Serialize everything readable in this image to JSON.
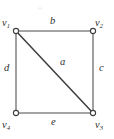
{
  "figure": {
    "type": "graph-diagram",
    "background_color": "#ffffff",
    "line_color": "#4a4a4a",
    "diagonal_color": "#3d3d3d",
    "text_color": "#2e2e2e",
    "vertex_fill": "#ffffff"
  },
  "vertices": [
    {
      "id": "v1",
      "letter": "v",
      "subscript": "1",
      "label": "v1",
      "x": 16,
      "y": 31,
      "label_x": 2,
      "label_y": 18
    },
    {
      "id": "v2",
      "letter": "v",
      "subscript": "2",
      "label": "v2",
      "x": 93,
      "y": 31,
      "label_x": 95,
      "label_y": 18
    },
    {
      "id": "v3",
      "letter": "v",
      "subscript": "3",
      "label": "v3",
      "x": 93,
      "y": 113,
      "label_x": 95,
      "label_y": 120
    },
    {
      "id": "v4",
      "letter": "v",
      "subscript": "4",
      "label": "v4",
      "x": 16,
      "y": 113,
      "label_x": 2,
      "label_y": 120
    }
  ],
  "edges": [
    {
      "id": "b",
      "label": "b",
      "from": "v1",
      "to": "v2",
      "position": "top",
      "x1": 16,
      "y1": 31,
      "x2": 93,
      "y2": 31,
      "label_x": 50,
      "label_y": 16
    },
    {
      "id": "c",
      "label": "c",
      "from": "v2",
      "to": "v3",
      "position": "right",
      "x1": 93,
      "y1": 31,
      "x2": 93,
      "y2": 113,
      "label_x": 99,
      "label_y": 63
    },
    {
      "id": "e",
      "label": "e",
      "from": "v4",
      "to": "v3",
      "position": "bottom",
      "x1": 16,
      "y1": 113,
      "x2": 93,
      "y2": 113,
      "label_x": 51,
      "label_y": 117
    },
    {
      "id": "d",
      "label": "d",
      "from": "v1",
      "to": "v4",
      "position": "left",
      "x1": 16,
      "y1": 31,
      "x2": 16,
      "y2": 113,
      "label_x": 4,
      "label_y": 63
    },
    {
      "id": "a",
      "label": "a",
      "from": "v1",
      "to": "v3",
      "position": "diagonal",
      "x1": 16,
      "y1": 31,
      "x2": 93,
      "y2": 113,
      "label_x": 60,
      "label_y": 57
    }
  ]
}
